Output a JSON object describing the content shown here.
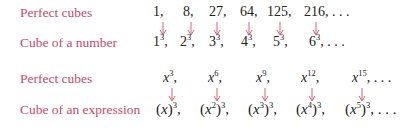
{
  "colors": {
    "label": "#c8486a",
    "arrow": "#d9607a",
    "text": "#222222"
  },
  "group1": {
    "top_label": "Perfect cubes",
    "bottom_label": "Cube of a number",
    "top": [
      {
        "text": "1,",
        "x": 153
      },
      {
        "text": "8,",
        "x": 183
      },
      {
        "text": "27,",
        "x": 209
      },
      {
        "text": "64,",
        "x": 240
      },
      {
        "text": "125,",
        "x": 267
      },
      {
        "text": "216, . . .",
        "x": 304
      }
    ],
    "bottom": [
      {
        "base": "1",
        "exp": "3",
        "tail": ",",
        "x": 153
      },
      {
        "base": "2",
        "exp": "3",
        "tail": ",",
        "x": 180
      },
      {
        "base": "3",
        "exp": "3",
        "tail": ",",
        "x": 209
      },
      {
        "base": "4",
        "exp": "3",
        "tail": ",",
        "x": 241
      },
      {
        "base": "5",
        "exp": "3",
        "tail": ",",
        "x": 273
      },
      {
        "base": "6",
        "exp": "3",
        "tail": ", . . .",
        "x": 309
      }
    ],
    "arrows_x": [
      159,
      187,
      213,
      245,
      276,
      312
    ]
  },
  "group2": {
    "top_label": "Perfect cubes",
    "bottom_label": "Cube of an expression",
    "top": [
      {
        "base": "x",
        "exp": "3",
        "tail": ",",
        "x": 163
      },
      {
        "base": "x",
        "exp": "6",
        "tail": ",",
        "x": 208
      },
      {
        "base": "x",
        "exp": "9",
        "tail": ",",
        "x": 256
      },
      {
        "base": "x",
        "exp": "12",
        "tail": ",",
        "x": 301
      },
      {
        "base": "x",
        "exp": "15",
        "tail": ", . . .",
        "x": 352
      }
    ],
    "bottom": [
      {
        "inner": "x",
        "inner_exp": "",
        "exp": "3",
        "tail": ",",
        "x": 156
      },
      {
        "inner": "x",
        "inner_exp": "2",
        "exp": "3",
        "tail": ",",
        "x": 200
      },
      {
        "inner": "x",
        "inner_exp": "3",
        "exp": "3",
        "tail": ",",
        "x": 248
      },
      {
        "inner": "x",
        "inner_exp": "4",
        "exp": "3",
        "tail": ",",
        "x": 296
      },
      {
        "inner": "x",
        "inner_exp": "5",
        "exp": "3",
        "tail": ", . . .",
        "x": 345
      }
    ],
    "arrows_x": [
      168,
      213,
      261,
      308,
      358
    ]
  }
}
